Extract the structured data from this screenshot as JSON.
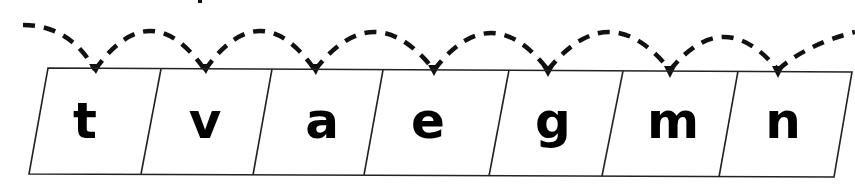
{
  "diagram": {
    "type": "letter-hop-track",
    "letters": [
      "t",
      "v",
      "a",
      "e",
      "g",
      "m",
      "n"
    ],
    "colors": {
      "stroke": "#111111",
      "text": "#000000",
      "background": "#ffffff"
    }
  }
}
